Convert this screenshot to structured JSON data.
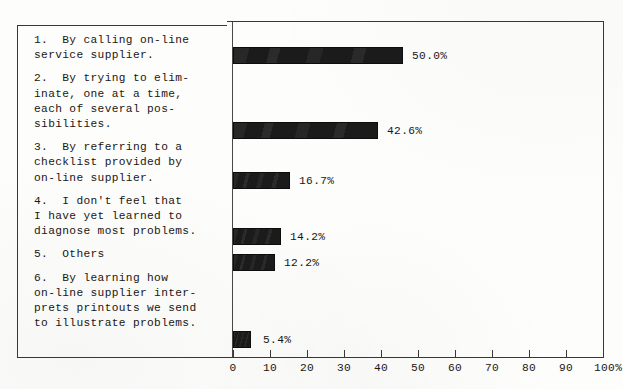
{
  "chart_data": {
    "type": "bar",
    "orientation": "horizontal",
    "title": "",
    "subtitle": "",
    "xlabel": "",
    "ylabel": "",
    "xlim": [
      0,
      100
    ],
    "xticks": [
      0,
      10,
      20,
      30,
      40,
      50,
      60,
      70,
      80,
      90,
      100
    ],
    "xtick_labels": [
      "0",
      "10",
      "20",
      "30",
      "40",
      "50",
      "60",
      "70",
      "80",
      "90",
      "100%"
    ],
    "grid": false,
    "legend": "none",
    "bar_color": "#1b1b1b",
    "frame_color": "#3a3734",
    "categories": [
      "1.  By calling on-line service supplier.",
      "2.  By trying to eliminate, one at a time, each of several possibilities.",
      "3.  By referring to a checklist provided by on-line supplier.",
      "4.  I don't feel that I have yet learned to diagnose most problems.",
      "5.  Others",
      "6.  By learning how on-line supplier interprets printouts we send to illustrate problems."
    ],
    "values": [
      50.0,
      42.6,
      16.7,
      14.2,
      12.2,
      5.4
    ],
    "value_labels": [
      "50.0%",
      "42.6%",
      "16.7%",
      "14.2%",
      "12.2%",
      "5.4%"
    ]
  },
  "labels": [
    {
      "lines": [
        "1.  By calling on-line",
        "service supplier."
      ]
    },
    {
      "lines": [
        "2.  By trying to elim-",
        "inate, one at a time,",
        "each of several pos-",
        "sibilities."
      ]
    },
    {
      "lines": [
        "3.  By referring to a",
        "checklist provided by",
        "on-line supplier."
      ]
    },
    {
      "lines": [
        "4.  I don't feel that",
        "I have yet learned to",
        "diagnose most problems."
      ]
    },
    {
      "lines": [
        "5.  Others"
      ]
    },
    {
      "lines": [
        "6.  By learning how",
        "on-line supplier inter-",
        "prets printouts we send",
        "to illustrate problems."
      ]
    }
  ],
  "bars": [
    {
      "value_label": "50.0%",
      "top": 47,
      "width": 170
    },
    {
      "value_label": "42.6%",
      "top": 122,
      "width": 145
    },
    {
      "value_label": "16.7%",
      "top": 172,
      "width": 57
    },
    {
      "value_label": "14.2%",
      "top": 228,
      "width": 48
    },
    {
      "value_label": "12.2%",
      "top": 254,
      "width": 42
    },
    {
      "value_label": "5.4%",
      "top": 331,
      "width": 18
    }
  ],
  "axis": {
    "ticks": [
      {
        "label": "0",
        "x": 233
      },
      {
        "label": "10",
        "x": 270
      },
      {
        "label": "20",
        "x": 307
      },
      {
        "label": "30",
        "x": 344
      },
      {
        "label": "40",
        "x": 381
      },
      {
        "label": "50",
        "x": 418
      },
      {
        "label": "60",
        "x": 455
      },
      {
        "label": "70",
        "x": 492
      },
      {
        "label": "80",
        "x": 529
      },
      {
        "label": "90",
        "x": 566
      },
      {
        "label": "100%",
        "x": 603
      }
    ]
  }
}
